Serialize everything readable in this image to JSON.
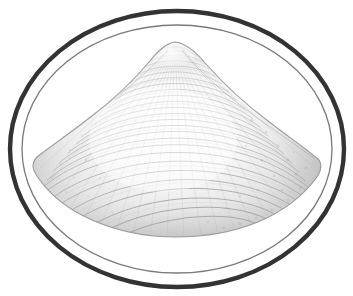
{
  "figure": {
    "kind": "scientific-illustration",
    "subject_name": "bivalve-shell",
    "style": "grayscale-engraving",
    "canvas": {
      "width": 353,
      "height": 296
    },
    "background_color": "#ffffff",
    "caption": "",
    "title": "",
    "labels": []
  },
  "frame": {
    "outer_ellipse": {
      "name": "outer-oval-border",
      "cx": 177,
      "cy": 149,
      "rx": 167,
      "ry": 138,
      "stroke_color": "#333333",
      "stroke_width": 4.4
    },
    "inner_ellipse": {
      "name": "inner-oval-border",
      "cx": 177,
      "cy": 149,
      "rx": 155,
      "ry": 124,
      "stroke_color": "#7a7a7a",
      "stroke_width": 1.3
    }
  },
  "shell": {
    "name": "clam-shell",
    "umbo": {
      "x": 175,
      "y": 42
    },
    "left_extent_x": 38,
    "right_extent_x": 320,
    "ventral_margin_y": 233,
    "widest_y": 162,
    "outline_color": "#8d8d8d",
    "outline_width": 1.1,
    "fill_highlight_color": "#fbfbfb",
    "fill_shadow_color": "#bdbdbd",
    "growth_ring_color": "#9a9a9a",
    "growth_ring_count": 26,
    "radial_stria_count": 34,
    "right_flank_tone": "#b4b4b4",
    "left_flank_tone": "#c8c8c8",
    "apex_highlight_color": "#ffffff"
  },
  "colors": {
    "border_dark": "#333333",
    "border_light": "#7a7a7a",
    "paper": "#ffffff",
    "ink_mid": "#9a9a9a",
    "ink_light": "#d0d0d0"
  }
}
